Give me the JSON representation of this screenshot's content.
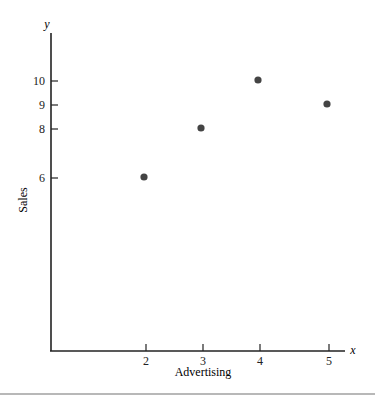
{
  "chart_data": {
    "type": "scatter",
    "title": "",
    "xlabel": "Advertising",
    "ylabel": "Sales",
    "x_axis_symbol": "x",
    "y_axis_symbol": "y",
    "x_ticks": [
      2,
      3,
      4,
      5
    ],
    "y_ticks": [
      6,
      8,
      9,
      10
    ],
    "points": [
      {
        "x": 2,
        "y": 6
      },
      {
        "x": 3,
        "y": 8
      },
      {
        "x": 4,
        "y": 10
      },
      {
        "x": 5,
        "y": 9
      }
    ],
    "grid": false,
    "legend": null,
    "colors": {
      "axis": "#222222",
      "point": "#444444",
      "rule": "#b8b8b8"
    }
  },
  "layout_px": {
    "origin": [
      51,
      351
    ],
    "x_tick_px": {
      "2": 146,
      "3": 203,
      "4": 260,
      "5": 329
    },
    "y_tick_px": {
      "6": 178,
      "8": 129,
      "9": 105,
      "10": 81
    },
    "y_axis_top": 33,
    "x_axis_right": 345
  }
}
